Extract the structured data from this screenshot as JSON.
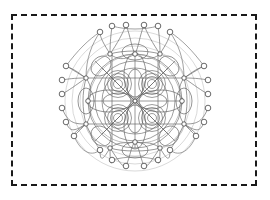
{
  "canvas": {
    "width": 270,
    "height": 200,
    "background": "#ffffff"
  },
  "frame": {
    "name": "dashed-border",
    "style": "dashed",
    "color": "#1a1a1a",
    "stroke_width": 2,
    "x": 11,
    "y": 14,
    "width": 246,
    "height": 172
  },
  "figure": {
    "title": "",
    "type": "symmetric-network-graph",
    "center": [
      135,
      101
    ],
    "radius_extent": 76,
    "stroke_color": "#555555",
    "node_fill": "#ffffff",
    "node_stroke": "#444444",
    "node_radius": 2.6,
    "symmetry_order": 4
  },
  "chart_data": {
    "type": "scatter",
    "title": "",
    "xlabel": "",
    "ylabel": "",
    "grid": false,
    "legend": null,
    "xlim": [
      0,
      270
    ],
    "ylim": [
      0,
      200
    ],
    "series": [
      {
        "name": "outer-ring-nodes",
        "count": 24,
        "values": [
          [
            100,
            32
          ],
          [
            112,
            26
          ],
          [
            126,
            25
          ],
          [
            144,
            25
          ],
          [
            158,
            26
          ],
          [
            170,
            32
          ],
          [
            188,
            39
          ],
          [
            198,
            49
          ],
          [
            204,
            62
          ],
          [
            206,
            76
          ],
          [
            206,
            92
          ],
          [
            203,
            106
          ],
          [
            198,
            120
          ],
          [
            188,
            133
          ],
          [
            170,
            150
          ],
          [
            158,
            160
          ],
          [
            144,
            166
          ],
          [
            126,
            166
          ],
          [
            112,
            160
          ],
          [
            100,
            150
          ],
          [
            82,
            133
          ],
          [
            72,
            120
          ],
          [
            66,
            106
          ],
          [
            64,
            92
          ]
        ]
      },
      {
        "name": "left-column-nodes",
        "count": 6,
        "values": [
          [
            66,
            66
          ],
          [
            62,
            80
          ],
          [
            62,
            94
          ],
          [
            62,
            108
          ],
          [
            66,
            122
          ],
          [
            74,
            136
          ]
        ]
      },
      {
        "name": "right-column-nodes",
        "count": 6,
        "values": [
          [
            204,
            66
          ],
          [
            208,
            80
          ],
          [
            208,
            94
          ],
          [
            208,
            108
          ],
          [
            204,
            122
          ],
          [
            196,
            136
          ]
        ]
      },
      {
        "name": "ring-hub-nodes",
        "count": 8,
        "values": [
          [
            110,
            54
          ],
          [
            160,
            54
          ],
          [
            86,
            78
          ],
          [
            184,
            78
          ],
          [
            86,
            124
          ],
          [
            184,
            124
          ],
          [
            110,
            148
          ],
          [
            160,
            148
          ]
        ]
      },
      {
        "name": "concentric-ring-centers",
        "count": 4,
        "values": [
          [
            118,
            84
          ],
          [
            152,
            84
          ],
          [
            118,
            118
          ],
          [
            152,
            118
          ]
        ],
        "rings_per_cluster": 4,
        "ring_radii": [
          4,
          7,
          10,
          13
        ]
      },
      {
        "name": "inner-lattice-nodes",
        "count": 9,
        "values": [
          [
            135,
            60
          ],
          [
            135,
            101
          ],
          [
            135,
            142
          ],
          [
            100,
            101
          ],
          [
            170,
            101
          ],
          [
            100,
            68
          ],
          [
            170,
            68
          ],
          [
            100,
            134
          ],
          [
            170,
            134
          ]
        ]
      }
    ]
  }
}
